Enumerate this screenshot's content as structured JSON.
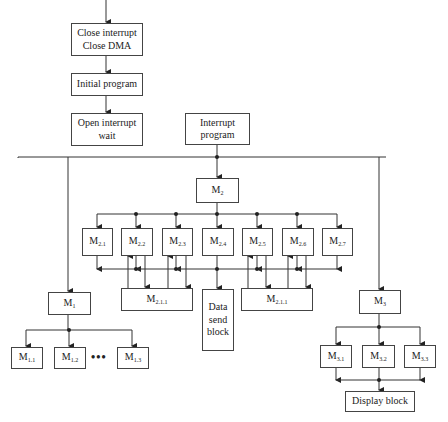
{
  "diagram": {
    "type": "flowchart",
    "main_flow": [
      {
        "id": "close",
        "label": "Close interrupt\nClose DMA"
      },
      {
        "id": "init",
        "label": "Initial program"
      },
      {
        "id": "open",
        "label": "Open interrupt\nwait"
      }
    ],
    "interrupt": {
      "id": "interrupt",
      "label": "Interrupt\nprogram"
    },
    "modules": {
      "m1": {
        "base": "M",
        "sub": "1"
      },
      "m2": {
        "base": "M",
        "sub": "2"
      },
      "m3": {
        "base": "M",
        "sub": "3"
      },
      "m2_children": [
        {
          "base": "M",
          "sub": "2.1"
        },
        {
          "base": "M",
          "sub": "2.2"
        },
        {
          "base": "M",
          "sub": "2.3"
        },
        {
          "base": "M",
          "sub": "2.4"
        },
        {
          "base": "M",
          "sub": "2.5"
        },
        {
          "base": "M",
          "sub": "2.6"
        },
        {
          "base": "M",
          "sub": "2.7"
        }
      ],
      "m211_left": {
        "base": "M",
        "sub": "2.1.1"
      },
      "m211_right": {
        "base": "M",
        "sub": "2.1.1"
      },
      "m1_children": [
        {
          "base": "M",
          "sub": "1.1"
        },
        {
          "base": "M",
          "sub": "1.2"
        },
        {
          "base": "M",
          "sub": "1.3"
        }
      ],
      "m1_ellipsis": "•••",
      "m3_children": [
        {
          "base": "M",
          "sub": "3.1"
        },
        {
          "base": "M",
          "sub": "3.2"
        },
        {
          "base": "M",
          "sub": "3.3"
        }
      ]
    },
    "data_send": {
      "label": "Data\nsend\nblock"
    },
    "display": {
      "label": "Display block"
    },
    "colors": {
      "line": "#333333",
      "box_border": "#444444",
      "background": "#ffffff"
    }
  }
}
